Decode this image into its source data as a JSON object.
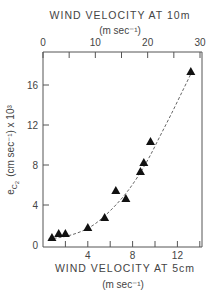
{
  "chart_data": {
    "type": "scatter",
    "title": "",
    "xlabel": "WIND VELOCITY AT 5cm",
    "xlabel_units": "(m sec⁻¹)",
    "ylabel": "e_C2 (cm sec⁻¹) x 10³",
    "ylabel_main": "e",
    "ylabel_sub": "C",
    "ylabel_subsub": "2",
    "ylabel_rest": "(cm sec⁻¹) x 10³",
    "top_xlabel": "WIND VELOCITY AT 10m",
    "top_xlabel_units": "(m sec⁻¹)",
    "xlim": [
      0,
      14.2
    ],
    "ylim": [
      0,
      18.5
    ],
    "top_xlim": [
      0,
      30
    ],
    "x_ticks": [
      4,
      8,
      12
    ],
    "x_minor_ticks": [
      2,
      6,
      10,
      14
    ],
    "y_ticks": [
      0,
      4,
      8,
      12,
      16
    ],
    "top_x_ticks": [
      0,
      10,
      20,
      30
    ],
    "top_x_minor_ticks": [
      5,
      15,
      25
    ],
    "grid": false,
    "legend": null,
    "marker": "filled-triangle",
    "series": [
      {
        "name": "observations",
        "x": [
          0.8,
          1.4,
          2.0,
          4.0,
          5.5,
          6.5,
          7.4,
          8.7,
          9.0,
          9.6,
          13.2
        ],
        "y": [
          0.7,
          1.1,
          1.1,
          1.7,
          2.7,
          5.4,
          4.6,
          7.3,
          8.2,
          10.3,
          17.3
        ]
      }
    ],
    "fit_curve": {
      "name": "fitted curve",
      "style": "dashed at low velocity, solid above",
      "x": [
        0.5,
        1.5,
        2.5,
        3.5,
        4.5,
        5.5,
        6.5,
        7.5,
        8.5,
        9.5,
        10.5,
        11.5,
        12.5,
        13.2
      ],
      "y": [
        0.6,
        0.75,
        1.0,
        1.4,
        2.0,
        2.9,
        4.0,
        5.3,
        6.9,
        8.8,
        11.0,
        13.2,
        15.5,
        17.1
      ]
    }
  }
}
